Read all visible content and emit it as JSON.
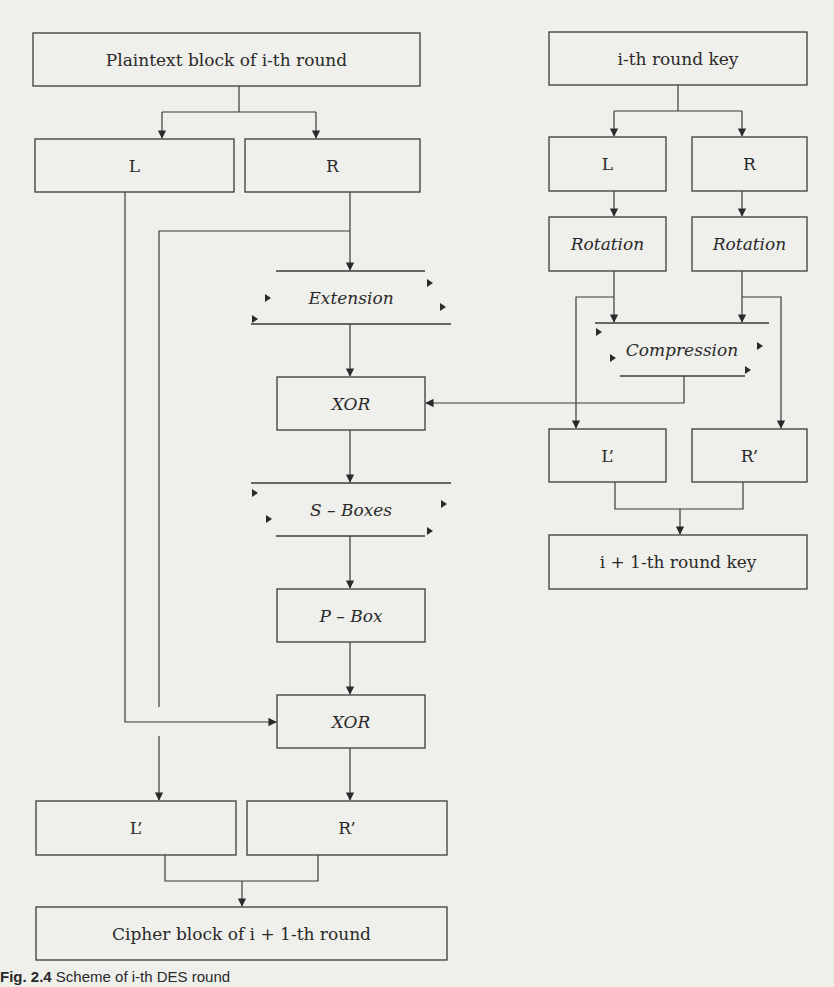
{
  "figure": {
    "title": "Scheme of i-th DES round",
    "caption_label": "Fig. 2.4",
    "caption_text": "Scheme of i-th DES round"
  },
  "data_path": {
    "plaintext": "Plaintext block of i-th round",
    "left": "L",
    "right": "R",
    "extension": "Extension",
    "xor1": "XOR",
    "sboxes": "S – Boxes",
    "pbox": "P – Box",
    "xor2": "XOR",
    "left_out": "L’",
    "right_out": "R’",
    "cipher": "Cipher block of i + 1-th round"
  },
  "key_path": {
    "round_key": "i-th round key",
    "left": "L",
    "right": "R",
    "rotation_left": "Rotation",
    "rotation_right": "Rotation",
    "compression": "Compression",
    "left_out": "L’",
    "right_out": "R’",
    "next_key": "i + 1-th round key"
  },
  "colors": {
    "background": "#efefec",
    "stroke": "#3a3a3a",
    "text": "#2a2a2a"
  }
}
